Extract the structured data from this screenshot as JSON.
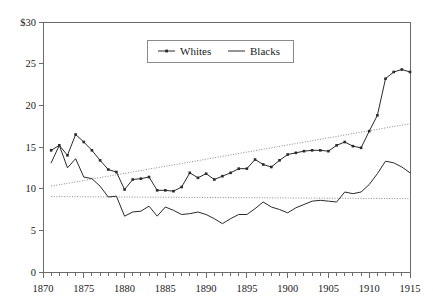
{
  "chart_data": {
    "type": "line",
    "title": "",
    "subtitle": "",
    "xlabel": "",
    "ylabel": "",
    "xlim": [
      1870,
      1915
    ],
    "ylim": [
      0,
      30
    ],
    "yticks": [
      0,
      5,
      10,
      15,
      20,
      25,
      30
    ],
    "ytick_labels": [
      "0",
      "5",
      "10",
      "15",
      "20",
      "25",
      "$30"
    ],
    "xticks": [
      1870,
      1875,
      1880,
      1885,
      1890,
      1895,
      1900,
      1905,
      1910,
      1915
    ],
    "xtick_labels": [
      "1870",
      "1875",
      "1880",
      "1885",
      "1890",
      "1895",
      "1900",
      "1905",
      "1910",
      "1915"
    ],
    "x_minor_tick_interval": 1,
    "grid": false,
    "legend": {
      "position": "top-center-inside",
      "entries": [
        {
          "name": "Whites",
          "marker": "square-dot",
          "line": "solid",
          "color": "#2a2a2a"
        },
        {
          "name": "Blacks",
          "marker": "none",
          "line": "solid",
          "color": "#2a2a2a"
        }
      ]
    },
    "x": [
      1871,
      1872,
      1873,
      1874,
      1875,
      1876,
      1877,
      1878,
      1879,
      1880,
      1881,
      1882,
      1883,
      1884,
      1885,
      1886,
      1887,
      1888,
      1889,
      1890,
      1891,
      1892,
      1893,
      1894,
      1895,
      1896,
      1897,
      1898,
      1899,
      1900,
      1901,
      1902,
      1903,
      1904,
      1905,
      1906,
      1907,
      1908,
      1909,
      1910,
      1911,
      1912,
      1913,
      1914,
      1915
    ],
    "series": [
      {
        "name": "Whites",
        "marker": "square-dot",
        "values": [
          14.6,
          15.2,
          14.0,
          16.5,
          15.6,
          14.6,
          13.4,
          12.3,
          12.0,
          9.9,
          11.1,
          11.2,
          11.4,
          9.8,
          9.8,
          9.7,
          10.2,
          11.9,
          11.3,
          11.8,
          11.1,
          11.5,
          11.9,
          12.4,
          12.4,
          13.5,
          12.9,
          12.6,
          13.4,
          14.1,
          14.3,
          14.5,
          14.6,
          14.6,
          14.5,
          15.2,
          15.6,
          15.1,
          14.9,
          16.9,
          18.8,
          23.2,
          24.0,
          24.3,
          24.0
        ]
      },
      {
        "name": "Blacks",
        "marker": "none",
        "values": [
          13.1,
          15.2,
          12.5,
          13.6,
          11.4,
          11.2,
          10.3,
          9.0,
          9.1,
          6.7,
          7.2,
          7.3,
          7.9,
          6.7,
          7.8,
          7.4,
          6.9,
          7.0,
          7.2,
          6.9,
          6.4,
          5.8,
          6.4,
          6.9,
          6.9,
          7.6,
          8.4,
          7.8,
          7.5,
          7.1,
          7.7,
          8.1,
          8.5,
          8.6,
          8.5,
          8.4,
          9.6,
          9.4,
          9.6,
          10.5,
          11.8,
          13.3,
          13.1,
          12.6,
          11.9
        ]
      }
    ],
    "trendlines": [
      {
        "name": "Whites trend",
        "style": "dotted",
        "x": [
          1871,
          1915
        ],
        "y": [
          10.3,
          17.8
        ]
      },
      {
        "name": "Blacks trend",
        "style": "dotted",
        "x": [
          1871,
          1915
        ],
        "y": [
          9.05,
          8.8
        ]
      }
    ]
  }
}
